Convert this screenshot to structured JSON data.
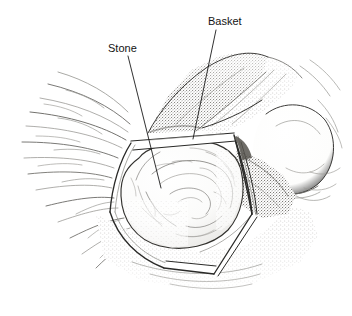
{
  "figure": {
    "kind": "medical-line-illustration",
    "medium": "pen-and-ink stipple drawing",
    "background_color": "#ffffff",
    "ink_color": "#33322f",
    "label_color": "#141414",
    "width": 352,
    "height": 316
  },
  "labels": [
    {
      "id": "stone",
      "text": "Stone",
      "text_x": 108,
      "text_y": 52,
      "leader_from_x": 128,
      "leader_from_y": 56,
      "leader_to_x": 161,
      "leader_to_y": 188
    },
    {
      "id": "basket",
      "text": "Basket",
      "text_x": 208,
      "text_y": 25,
      "leader_from_x": 216,
      "leader_from_y": 30,
      "leader_to_x": 193,
      "leader_to_y": 139
    }
  ],
  "anatomy": {
    "stone_label": "Stone",
    "basket_label": "Basket",
    "tissue_flap_label": "shaded mucosal flap",
    "lobe_label": "rounded tissue lobe",
    "folds_label": "radiating mucosal folds"
  }
}
